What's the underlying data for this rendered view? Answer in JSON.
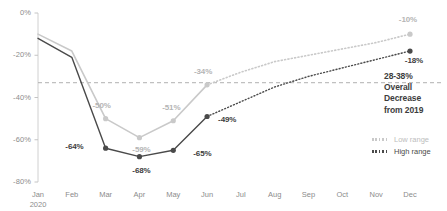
{
  "chart_data": {
    "type": "line",
    "title": "",
    "subtitle": "",
    "xlabel": "",
    "ylabel": "",
    "categories": [
      "Jan 2020",
      "Feb",
      "Mar",
      "Apr",
      "May",
      "Jun",
      "Jul",
      "Aug",
      "Sep",
      "Oct",
      "Nov",
      "Dec"
    ],
    "xtick_labels": [
      {
        "line1": "Jan",
        "line2": "2020"
      },
      {
        "line1": "Feb",
        "line2": ""
      },
      {
        "line1": "Mar",
        "line2": ""
      },
      {
        "line1": "Apr",
        "line2": ""
      },
      {
        "line1": "May",
        "line2": ""
      },
      {
        "line1": "Jun",
        "line2": ""
      },
      {
        "line1": "Jul",
        "line2": ""
      },
      {
        "line1": "Aug",
        "line2": ""
      },
      {
        "line1": "Sep",
        "line2": ""
      },
      {
        "line1": "Oct",
        "line2": ""
      },
      {
        "line1": "Nov",
        "line2": ""
      },
      {
        "line1": "Dec",
        "line2": ""
      }
    ],
    "ylim": [
      -80,
      0
    ],
    "ytick_labels": [
      "0%",
      "-20%",
      "-40%",
      "-60%",
      "-80%"
    ],
    "ytick_values": [
      0,
      -20,
      -40,
      -60,
      -80
    ],
    "grid": false,
    "legend_position": "right",
    "series": [
      {
        "name": "Low range",
        "color": "#c9c9c9",
        "values": [
          -10,
          -18,
          -50,
          -59,
          -51,
          -34,
          -28,
          -23,
          -20,
          -17,
          -14,
          -10
        ],
        "point_labels": [
          {
            "index": 2,
            "text": "-50%"
          },
          {
            "index": 3,
            "text": "-59%"
          },
          {
            "index": 4,
            "text": "-51%"
          },
          {
            "index": 5,
            "text": "-34%"
          },
          {
            "index": 11,
            "text": "-10%"
          }
        ]
      },
      {
        "name": "High range",
        "color": "#4a4a4a",
        "values": [
          -12,
          -21,
          -64,
          -68,
          -65,
          -49,
          -42,
          -35,
          -30,
          -26,
          -22,
          -18
        ],
        "point_labels": [
          {
            "index": 2,
            "text": "-64%"
          },
          {
            "index": 3,
            "text": "-68%"
          },
          {
            "index": 4,
            "text": "-65%"
          },
          {
            "index": 5,
            "text": "-49%"
          },
          {
            "index": 11,
            "text": "-18%"
          }
        ]
      }
    ],
    "reference_line": {
      "value": -33,
      "style": "dashed",
      "color": "#b0b0b0"
    },
    "annotation": {
      "lines": [
        "28-38%",
        "Overall",
        "Decrease",
        "from 2019"
      ],
      "color": "#3d3d3d"
    },
    "legend": [
      {
        "name": "Low range",
        "style": "dotted",
        "color": "#c9c9c9"
      },
      {
        "name": "High range",
        "style": "dotted",
        "color": "#4a4a4a"
      }
    ]
  }
}
